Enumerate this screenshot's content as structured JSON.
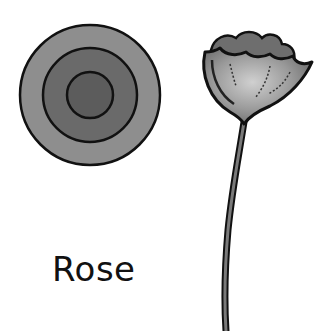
{
  "label": "Rose",
  "figures": {
    "top_view": {
      "name": "rose-top-view",
      "rings": 3
    },
    "side_view": {
      "name": "rose-side-view"
    }
  },
  "colors": {
    "outline": "#111111",
    "outer_ring": "#8e8e8e",
    "middle_ring": "#6a6a6a",
    "inner_ring": "#5c5c5c",
    "petal_light": "#b8b8b8",
    "petal_dark": "#6e6e6e",
    "stem": "#555555",
    "background": "#ffffff"
  }
}
